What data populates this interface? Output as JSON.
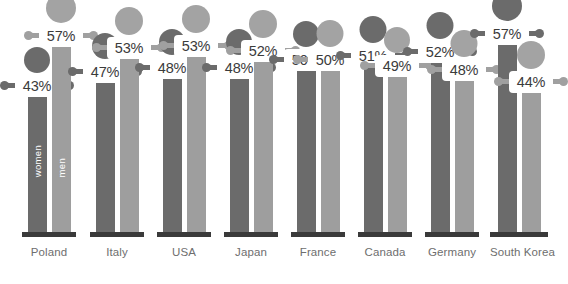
{
  "chart_data": {
    "type": "bar",
    "title": "",
    "subtitle": "",
    "xlabel": "",
    "ylabel": "",
    "grid": false,
    "legend_position": "in-bar",
    "units": "%",
    "categories": [
      "Poland",
      "Italy",
      "USA",
      "Japan",
      "France",
      "Canada",
      "Germany",
      "South Korea"
    ],
    "series": [
      {
        "name": "women",
        "color": "#6b6b6b",
        "values": [
          43,
          47,
          48,
          48,
          50,
          51,
          52,
          57
        ]
      },
      {
        "name": "men",
        "color": "#9e9e9e",
        "values": [
          57,
          53,
          53,
          52,
          50,
          49,
          48,
          44
        ]
      }
    ],
    "annotations": [
      {
        "country": "Poland",
        "women": "43%",
        "men": "57%"
      },
      {
        "country": "Italy",
        "women": "47%",
        "men": "53%"
      },
      {
        "country": "USA",
        "women": "48%",
        "men": "53%"
      },
      {
        "country": "Japan",
        "women": "48%",
        "men": "52%"
      },
      {
        "country": "France",
        "women": "50%",
        "men": "50%"
      },
      {
        "country": "Canada",
        "women": "51%",
        "men": "50%"
      },
      {
        "country": "Germany",
        "women": "52%",
        "men": "48%"
      },
      {
        "country": "South Korea",
        "women": "57%",
        "men": "44%"
      }
    ]
  },
  "legend": {
    "women_label": "women",
    "men_label": "men"
  },
  "colors": {
    "women": "#6b6b6b",
    "men": "#9e9e9e",
    "baseline": "#3a3a3a",
    "label_text": "#6e6e6e",
    "pill_text": "#3b3b3b",
    "background": "#ffffff"
  },
  "groups": [
    {
      "name": "Poland",
      "women": {
        "value": "43%",
        "height": 146,
        "head_size": 26,
        "pill_top": 118
      },
      "men": {
        "value": "57%",
        "height": 196,
        "head_size": 30,
        "pill_top": 168
      }
    },
    {
      "name": "Italy",
      "women": {
        "value": "47%",
        "height": 160,
        "head_size": 26,
        "pill_top": 132
      },
      "men": {
        "value": "53%",
        "height": 184,
        "head_size": 28,
        "pill_top": 156
      }
    },
    {
      "name": "USA",
      "women": {
        "value": "48%",
        "height": 164,
        "head_size": 26,
        "pill_top": 136
      },
      "men": {
        "value": "53%",
        "height": 186,
        "head_size": 28,
        "pill_top": 158
      }
    },
    {
      "name": "Japan",
      "women": {
        "value": "48%",
        "height": 164,
        "head_size": 26,
        "pill_top": 136
      },
      "men": {
        "value": "52%",
        "height": 181,
        "head_size": 28,
        "pill_top": 153
      }
    },
    {
      "name": "France",
      "women": {
        "value": "50%",
        "height": 172,
        "head_size": 26,
        "pill_top": 144
      },
      "men": {
        "value": "50%",
        "height": 172,
        "head_size": 27,
        "pill_top": 144
      }
    },
    {
      "name": "Canada",
      "women": {
        "value": "51%",
        "height": 176,
        "head_size": 27,
        "pill_top": 148
      },
      "men": {
        "value": "49%",
        "height": 166,
        "head_size": 26,
        "pill_top": 138
      }
    },
    {
      "name": "Germany",
      "women": {
        "value": "52%",
        "height": 180,
        "head_size": 27,
        "pill_top": 152
      },
      "men": {
        "value": "48%",
        "height": 162,
        "head_size": 27,
        "pill_top": 134
      }
    },
    {
      "name": "South Korea",
      "women": {
        "value": "57%",
        "height": 198,
        "head_size": 30,
        "pill_top": 170
      },
      "men": {
        "value": "44%",
        "height": 150,
        "head_size": 28,
        "pill_top": 122
      }
    }
  ]
}
